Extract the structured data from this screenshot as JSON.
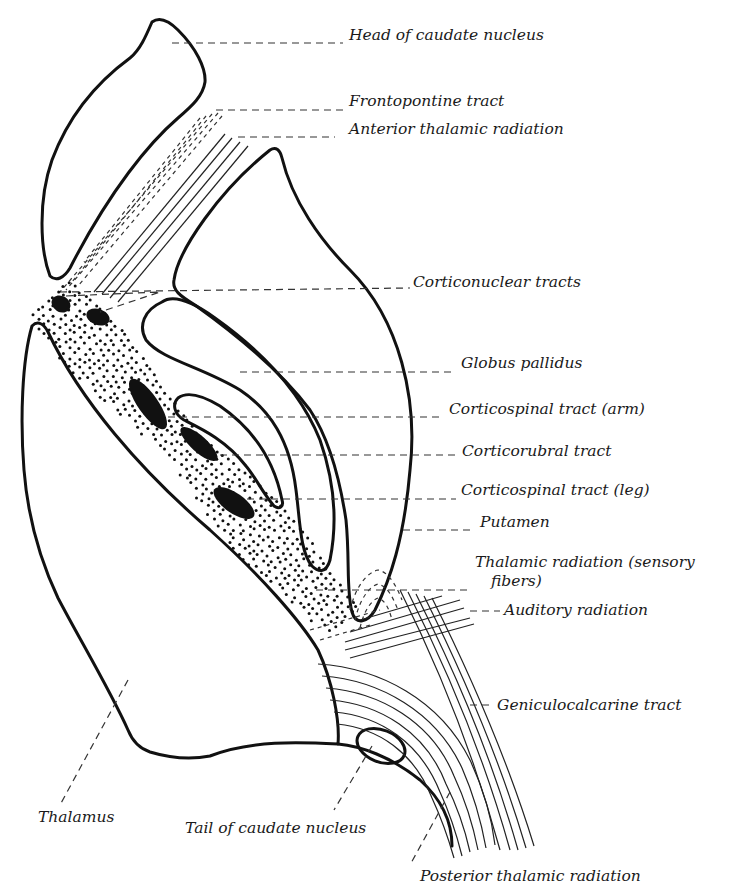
{
  "diagram": {
    "labels": [
      {
        "id": "head-caudate",
        "text": "Head of caudate nucleus",
        "x": 349,
        "y": 40
      },
      {
        "id": "frontopontine",
        "text": "Frontopontine tract",
        "x": 349,
        "y": 106
      },
      {
        "id": "anterior-thalamic",
        "text": "Anterior thalamic radiation",
        "x": 349,
        "y": 134
      },
      {
        "id": "corticonuclear",
        "text": "Corticonuclear tracts",
        "x": 413,
        "y": 287
      },
      {
        "id": "globus-pallidus",
        "text": "Globus pallidus",
        "x": 461,
        "y": 368
      },
      {
        "id": "corticospinal-arm",
        "text": "Corticospinal tract (arm)",
        "x": 449,
        "y": 414
      },
      {
        "id": "corticorubral",
        "text": "Corticorubral tract",
        "x": 462,
        "y": 456
      },
      {
        "id": "corticospinal-leg",
        "text": "Corticospinal tract (leg)",
        "x": 461,
        "y": 495
      },
      {
        "id": "putamen",
        "text": "Putamen",
        "x": 480,
        "y": 527
      },
      {
        "id": "thalamic-sensory-1",
        "text": "Thalamic radiation (sensory",
        "x": 475,
        "y": 567
      },
      {
        "id": "thalamic-sensory-2",
        "text": "fibers)",
        "x": 491,
        "y": 586
      },
      {
        "id": "auditory",
        "text": "Auditory radiation",
        "x": 504,
        "y": 615
      },
      {
        "id": "geniculocalcarine",
        "text": "Geniculocalcarine tract",
        "x": 497,
        "y": 710
      },
      {
        "id": "thalamus",
        "text": "Thalamus",
        "x": 38,
        "y": 822
      },
      {
        "id": "tail-caudate",
        "text": "Tail of caudate nucleus",
        "x": 185,
        "y": 833
      },
      {
        "id": "posterior-thalamic",
        "text": "Posterior thalamic radiation",
        "x": 420,
        "y": 881
      }
    ]
  }
}
